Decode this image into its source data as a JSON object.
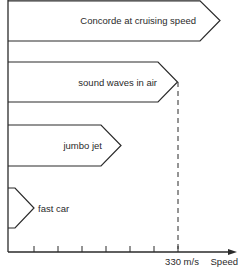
{
  "diagram": {
    "type": "speed-comparison",
    "axis": {
      "x_label": "Speed",
      "marked_value_label": "330 m/s",
      "tick_count": 7
    },
    "bars": [
      {
        "id": "concorde",
        "label": "Concorde at cruising speed",
        "relative_length": "greater than speed of sound"
      },
      {
        "id": "sound",
        "label": "sound waves in air",
        "relative_length": "330 m/s"
      },
      {
        "id": "jumbo",
        "label": "jumbo jet",
        "relative_length": "less than speed of sound"
      },
      {
        "id": "car",
        "label": "fast car",
        "relative_length": "much less than speed of sound"
      }
    ],
    "colors": {
      "line": "#2a2a2a",
      "background": "#ffffff"
    }
  }
}
